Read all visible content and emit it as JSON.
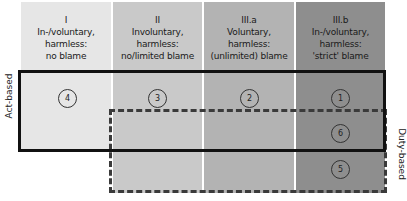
{
  "diagram": {
    "columns": [
      {
        "id": "I",
        "line1": "I",
        "line2": "In-/voluntary,",
        "line3": "harmless:",
        "line4": "no blame",
        "shade": "#e6e6e6"
      },
      {
        "id": "II",
        "line1": "II",
        "line2": "Involuntary,",
        "line3": "harmless:",
        "line4": "no/limited blame",
        "shade": "#c9c9c9"
      },
      {
        "id": "III.a",
        "line1": "III.a",
        "line2": "Voluntary,",
        "line3": "harmless:",
        "line4": "(unlimited) blame",
        "shade": "#b3b3b3"
      },
      {
        "id": "III.b",
        "line1": "III.b",
        "line2": "In-/voluntary,",
        "line3": "harmless:",
        "line4": "'strict' blame",
        "shade": "#8e8e8e"
      }
    ],
    "regions": {
      "act_based": {
        "label": "Act-based",
        "style": "solid"
      },
      "duty_based": {
        "label": "Duty-based",
        "style": "dashed"
      }
    },
    "markers": [
      {
        "number": "4",
        "column": "I"
      },
      {
        "number": "3",
        "column": "II"
      },
      {
        "number": "2",
        "column": "III.a"
      },
      {
        "number": "1",
        "column": "III.b"
      },
      {
        "number": "6",
        "column": "III.b"
      },
      {
        "number": "5",
        "column": "III.b"
      }
    ]
  }
}
